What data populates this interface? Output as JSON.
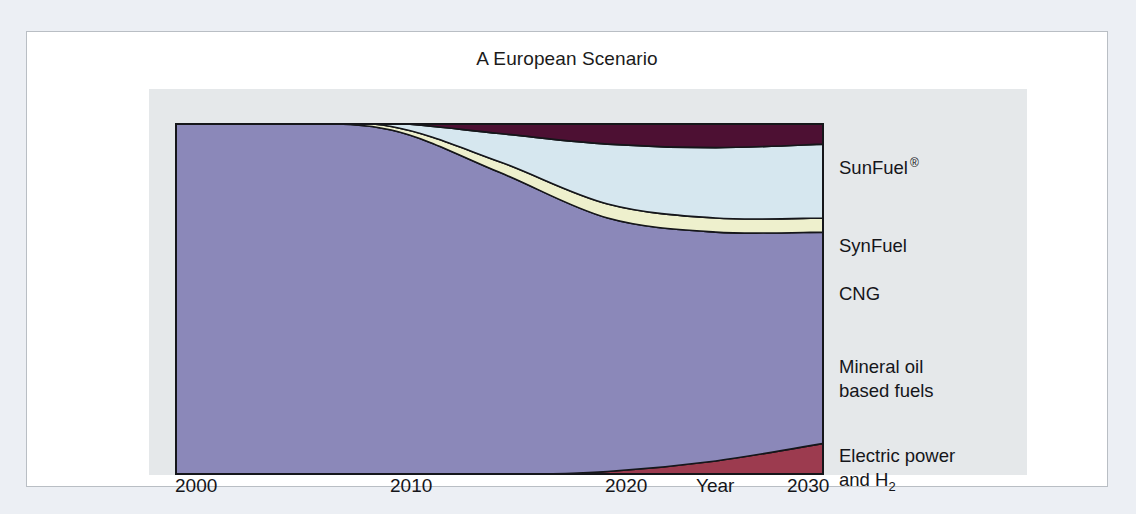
{
  "card": {
    "title": "A European Scenario"
  },
  "axis": {
    "title": "Year",
    "ticks": [
      "2000",
      "2010",
      "2020",
      "2030"
    ]
  },
  "legend": {
    "items": [
      {
        "label": "SunFuel",
        "mark": "®",
        "sub": "",
        "line2": "",
        "color": "#4d1033"
      },
      {
        "label": "SynFuel",
        "mark": "",
        "sub": "",
        "line2": "",
        "color": "#d6e7ef"
      },
      {
        "label": "CNG",
        "mark": "",
        "sub": "",
        "line2": "",
        "color": "#eef0cd"
      },
      {
        "label": "Mineral oil",
        "mark": "",
        "sub": "",
        "line2": "based fuels",
        "color": "#8b88b9"
      },
      {
        "label": "Electric power",
        "mark": "",
        "sub": "",
        "line2": "and H",
        "sub2": "2",
        "color": "#9c3b4f"
      }
    ]
  },
  "chart_data": {
    "type": "area",
    "stacked": true,
    "title": "A European Scenario",
    "xlabel": "Year",
    "ylabel": "",
    "xlim": [
      2000,
      2030
    ],
    "ylim": [
      0,
      100
    ],
    "grid": false,
    "legend_position": "right",
    "x": [
      2000,
      2005,
      2010,
      2015,
      2020,
      2025,
      2030
    ],
    "series": [
      {
        "name": "Electric power and H2",
        "color": "#9c3b4f",
        "values": [
          0,
          0,
          0,
          0,
          1,
          4,
          9
        ]
      },
      {
        "name": "Mineral oil based fuels",
        "color": "#8b88b9",
        "values": [
          100,
          100,
          98,
          86,
          72,
          65,
          60
        ]
      },
      {
        "name": "CNG",
        "color": "#eef0cd",
        "values": [
          0,
          0,
          1,
          3,
          4,
          4,
          4
        ]
      },
      {
        "name": "SynFuel",
        "color": "#d6e7ef",
        "values": [
          0,
          0,
          1,
          8,
          17,
          20,
          21
        ]
      },
      {
        "name": "SunFuel",
        "color": "#4d1033",
        "values": [
          0,
          0,
          0,
          3,
          6,
          7,
          6
        ]
      }
    ]
  }
}
